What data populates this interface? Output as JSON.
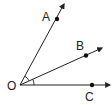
{
  "diagram": {
    "vertex": {
      "label": "O",
      "x": 20,
      "y": 85
    },
    "rays": [
      {
        "name": "OA",
        "end": {
          "x": 64,
          "y": 4
        },
        "point": {
          "label": "A",
          "x": 57,
          "y": 19
        }
      },
      {
        "name": "OB",
        "end": {
          "x": 102,
          "y": 48
        },
        "point": {
          "label": "B",
          "x": 86,
          "y": 56
        }
      },
      {
        "name": "OC",
        "end": {
          "x": 110,
          "y": 85
        },
        "point": {
          "label": "C",
          "x": 92,
          "y": 85
        }
      }
    ],
    "angle_marks": [
      {
        "between": "AOB",
        "radius": 10
      },
      {
        "between": "BOC",
        "radius": 14
      }
    ],
    "colors": {
      "stroke": "#222222",
      "background": "#ffffff"
    }
  }
}
